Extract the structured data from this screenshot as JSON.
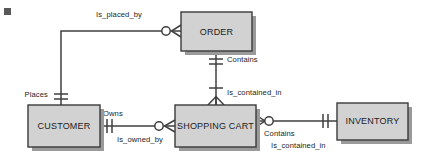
{
  "diagram": {
    "type": "entity-relationship-diagram",
    "notation": "crows-foot",
    "background_color": "#ffffff",
    "entity_fill_color": "#d2d2d2",
    "entity_border_color": "#3a3a3a",
    "line_color": "#3f3f3f",
    "text_color": "#1c1c1c"
  },
  "entities": [
    {
      "id": "order",
      "label": "ORDER",
      "x": 181,
      "y": 12,
      "w": 71,
      "h": 39
    },
    {
      "id": "customer",
      "label": "CUSTOMER",
      "x": 28,
      "y": 105,
      "w": 72,
      "h": 42
    },
    {
      "id": "shopping_cart",
      "label": "SHOPPING CART",
      "x": 175,
      "y": 105,
      "w": 81,
      "h": 42
    },
    {
      "id": "inventory",
      "label": "INVENTORY",
      "x": 337,
      "y": 103,
      "w": 71,
      "h": 37
    }
  ],
  "relationships": [
    {
      "id": "customer-order",
      "from": "customer",
      "to": "order",
      "from_label": "Places",
      "to_label": "Is_placed_by",
      "from_cardinality": "one-and-only-one",
      "to_cardinality": "zero-or-more"
    },
    {
      "id": "order-shopping-cart",
      "from": "order",
      "to": "shopping_cart",
      "from_label": "Contains",
      "to_label": "Is_contained_in",
      "from_cardinality": "one-and-only-one",
      "to_cardinality": "one-or-more"
    },
    {
      "id": "customer-shopping-cart",
      "from": "customer",
      "to": "shopping_cart",
      "from_label": "Owns",
      "to_label": "Is_owned_by",
      "from_cardinality": "one-and-only-one",
      "to_cardinality": "zero-or-more"
    },
    {
      "id": "shopping-cart-inventory",
      "from": "shopping_cart",
      "to": "inventory",
      "from_label": "Contains",
      "to_label": "Is_contained_in",
      "from_cardinality": "zero-or-more",
      "to_cardinality": "one-and-only-one"
    }
  ],
  "labels": {
    "is_placed_by": "Is_placed_by",
    "places": "Places",
    "contains_order": "Contains",
    "is_contained_in_cart": "Is_contained_in",
    "owns": "Owns",
    "is_owned_by": "Is_owned_by",
    "contains_inventory": "Contains",
    "is_contained_in_inventory": "Is_contained_in"
  },
  "entity_names": {
    "order": "ORDER",
    "customer": "CUSTOMER",
    "shopping_cart": "SHOPPING CART",
    "inventory": "INVENTORY"
  }
}
